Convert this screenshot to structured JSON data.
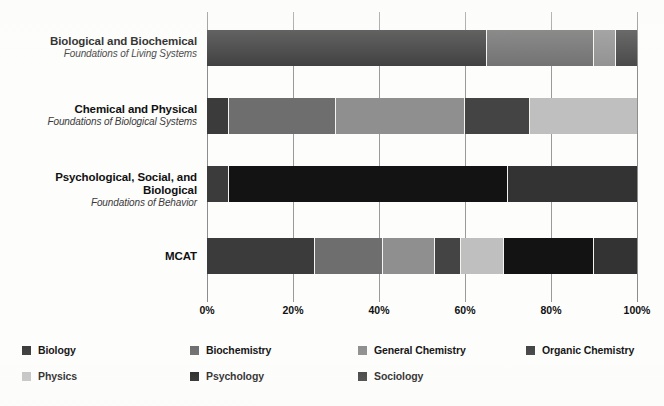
{
  "chart_data": {
    "type": "bar",
    "orientation": "horizontal",
    "stacked": true,
    "normalized_percent": true,
    "title": "",
    "xlabel": "",
    "ylabel": "",
    "xlim": [
      0,
      100
    ],
    "grid": true,
    "legend_position": "bottom",
    "xticks": [
      "0%",
      "20%",
      "40%",
      "60%",
      "80%",
      "100%"
    ],
    "xtick_values": [
      0,
      20,
      40,
      60,
      80,
      100
    ],
    "categories": [
      {
        "main": "Biological and Biochemical",
        "sub": "Foundations of Living Systems"
      },
      {
        "main": "Chemical and Physical",
        "sub": "Foundations of Biological Systems"
      },
      {
        "main": "Psychological, Social, and Biological",
        "sub": "Foundations of Behavior"
      },
      {
        "main": "MCAT",
        "sub": ""
      }
    ],
    "series": [
      {
        "name": "Biology",
        "color": "#3b3b3b",
        "values": [
          65,
          5,
          5,
          25
        ]
      },
      {
        "name": "Biochemistry",
        "color": "#6e6e6e",
        "values": [
          25,
          25,
          0,
          16
        ]
      },
      {
        "name": "General Chemistry",
        "color": "#8f8f8f",
        "values": [
          5,
          30,
          0,
          12
        ]
      },
      {
        "name": "Organic Chemistry",
        "color": "#444444",
        "values": [
          5,
          15,
          0,
          6
        ]
      },
      {
        "name": "Physics",
        "color": "#bfbfbf",
        "values": [
          0,
          25,
          0,
          10
        ]
      },
      {
        "name": "Psychology",
        "color": "#131313",
        "values": [
          0,
          0,
          65,
          21
        ]
      },
      {
        "name": "Sociology",
        "color": "#333333",
        "values": [
          0,
          0,
          30,
          10
        ]
      }
    ]
  },
  "legend": {
    "items": [
      {
        "label": "Biology",
        "color": "#3b3b3b"
      },
      {
        "label": "Biochemistry",
        "color": "#6e6e6e"
      },
      {
        "label": "General Chemistry",
        "color": "#8f8f8f"
      },
      {
        "label": "Organic Chemistry",
        "color": "#444444"
      },
      {
        "label": "Physics",
        "color": "#bfbfbf"
      },
      {
        "label": "Psychology",
        "color": "#131313"
      },
      {
        "label": "Sociology",
        "color": "#333333"
      }
    ]
  }
}
